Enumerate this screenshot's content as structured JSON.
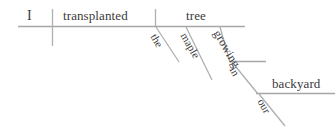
{
  "diagram": {
    "type": "reed-kellogg-sentence-diagram",
    "sentence": "I transplanted the maple tree growing in our backyard",
    "line_color": "#a6a6a6",
    "text_color": "#3a3a3a",
    "background_color": "#ffffff",
    "words": {
      "subject": "I",
      "verb": "transplanted",
      "object": "tree",
      "article": "the",
      "adjective": "maple",
      "participle": "growing",
      "preposition": "in",
      "prep_object": "backyard",
      "possessive": "our"
    },
    "baselines": [
      {
        "name": "main-baseline",
        "x1": 18,
        "y1": 26.5,
        "x2": 245,
        "y2": 26.5
      },
      {
        "name": "growing-baseline",
        "x1": 229,
        "y1": 61.5,
        "x2": 266,
        "y2": 61.5
      },
      {
        "name": "backyard-baseline",
        "x1": 256,
        "y1": 93.5,
        "x2": 335,
        "y2": 93.5
      }
    ],
    "dividers": [
      {
        "name": "subject-verb-divider",
        "x1": 52.5,
        "y1": 9,
        "x2": 52.5,
        "y2": 46
      },
      {
        "name": "verb-object-divider",
        "x1": 155.5,
        "y1": 9,
        "x2": 155.5,
        "y2": 26.5
      }
    ],
    "modifier_slants": [
      {
        "name": "the-slant",
        "x1": 156,
        "y1": 27,
        "x2": 179,
        "y2": 62
      },
      {
        "name": "maple-slant",
        "x1": 186,
        "y1": 27,
        "x2": 212,
        "y2": 80
      },
      {
        "name": "growing-slant",
        "x1": 220,
        "y1": 27,
        "x2": 230,
        "y2": 62
      },
      {
        "name": "in-slant",
        "x1": 232,
        "y1": 62,
        "x2": 258,
        "y2": 94
      },
      {
        "name": "our-slant",
        "x1": 259,
        "y1": 94,
        "x2": 285,
        "y2": 126
      }
    ]
  }
}
